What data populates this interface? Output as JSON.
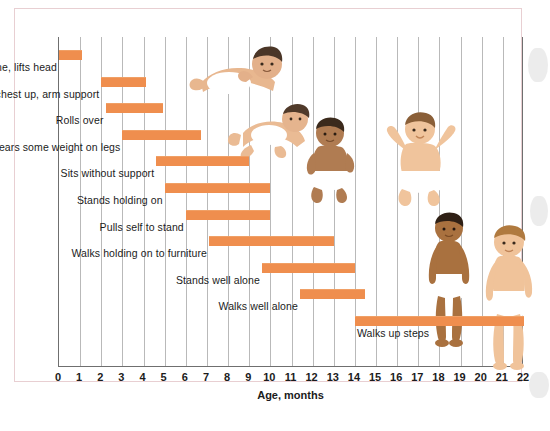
{
  "chart_data": {
    "type": "bar",
    "orientation": "horizontal-range",
    "title": "",
    "xlabel": "Age, months",
    "ylabel": "",
    "xlim": [
      0,
      22
    ],
    "xticks": [
      "0",
      "1",
      "2",
      "3",
      "4",
      "5",
      "6",
      "7",
      "8",
      "9",
      "10",
      "11",
      "12",
      "13",
      "14",
      "15",
      "16",
      "17",
      "18",
      "19",
      "20",
      "21",
      "22"
    ],
    "grid": true,
    "legend": "none",
    "bar_color": "#ef8e4e",
    "categories": [
      "Prone, lifts head",
      "Prone, chest up, arm support",
      "Rolls over",
      "Bears some weight on legs",
      "Sits without support",
      "Stands holding on",
      "Pulls self to stand",
      "Walks holding on to furniture",
      "Stands well alone",
      "Walks well alone",
      "Walks up steps"
    ],
    "bars": [
      {
        "label": "Prone, lifts head",
        "start": 0.0,
        "end": 1.1
      },
      {
        "label": "Prone, chest up, arm support",
        "start": 2.0,
        "end": 4.1
      },
      {
        "label": "Rolls over",
        "start": 2.2,
        "end": 4.9
      },
      {
        "label": "Bears some weight on legs",
        "start": 3.0,
        "end": 6.7
      },
      {
        "label": "Sits without support",
        "start": 4.6,
        "end": 9.0
      },
      {
        "label": "Stands holding on",
        "start": 5.0,
        "end": 10.0
      },
      {
        "label": "Pulls self to stand",
        "start": 6.0,
        "end": 10.0
      },
      {
        "label": "Walks holding on to furniture",
        "start": 7.1,
        "end": 13.0
      },
      {
        "label": "Stands well alone",
        "start": 9.6,
        "end": 14.0
      },
      {
        "label": "Walks well alone",
        "start": 11.4,
        "end": 14.5
      },
      {
        "label": "Walks up steps",
        "start": 14.0,
        "end": 22.0
      }
    ]
  },
  "axis": {
    "x_title": "Age, months",
    "ticks": [
      "0",
      "1",
      "2",
      "3",
      "4",
      "5",
      "6",
      "7",
      "8",
      "9",
      "10",
      "11",
      "12",
      "13",
      "14",
      "15",
      "16",
      "17",
      "18",
      "19",
      "20",
      "21",
      "22"
    ]
  },
  "illustrations": [
    {
      "name": "baby-prone-lifting-head",
      "caption": ""
    },
    {
      "name": "baby-rolling-over",
      "caption": ""
    },
    {
      "name": "baby-sitting-unsupported",
      "caption": ""
    },
    {
      "name": "baby-sitting-arms-raised",
      "caption": ""
    },
    {
      "name": "toddler-standing-alone",
      "caption": ""
    },
    {
      "name": "toddler-walking",
      "caption": ""
    }
  ]
}
